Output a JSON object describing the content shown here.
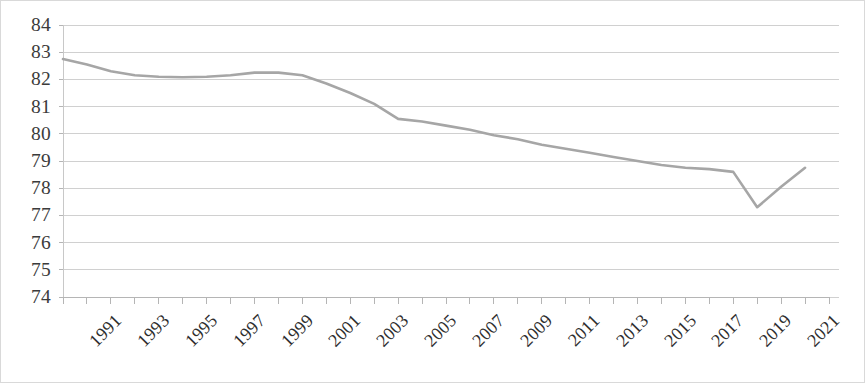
{
  "chart_data": {
    "type": "line",
    "title": "",
    "subtitle": "",
    "xlabel": "",
    "ylabel": "",
    "grid": true,
    "legend": false,
    "legend_position": "none",
    "line_color": "#a6a6a6",
    "gridline_color": "#d0d0d0",
    "axis_color": "#c8c8c8",
    "ylim": [
      74,
      84
    ],
    "ytick_labels": [
      "84",
      "83",
      "82",
      "81",
      "80",
      "79",
      "78",
      "77",
      "76",
      "75",
      "74"
    ],
    "ytick_values": [
      84,
      83,
      82,
      81,
      80,
      79,
      78,
      77,
      76,
      75,
      74
    ],
    "xtick_labels": [
      "1991",
      "1993",
      "1995",
      "1997",
      "1999",
      "2001",
      "2003",
      "2005",
      "2007",
      "2009",
      "2011",
      "2013",
      "2015",
      "2017",
      "2019",
      "2021"
    ],
    "xtick_values": [
      1991,
      1993,
      1995,
      1997,
      1999,
      2001,
      2003,
      2005,
      2007,
      2009,
      2011,
      2013,
      2015,
      2017,
      2019,
      2021
    ],
    "xlim": [
      1991,
      2023
    ],
    "x": [
      1991,
      1992,
      1993,
      1994,
      1995,
      1996,
      1997,
      1998,
      1999,
      2000,
      2001,
      2002,
      2003,
      2004,
      2005,
      2006,
      2007,
      2008,
      2009,
      2010,
      2011,
      2012,
      2013,
      2014,
      2015,
      2016,
      2017,
      2018,
      2019,
      2020,
      2021,
      2022
    ],
    "values": [
      82.75,
      82.55,
      82.3,
      82.15,
      82.1,
      82.08,
      82.1,
      82.15,
      82.25,
      82.25,
      82.15,
      81.85,
      81.5,
      81.1,
      80.55,
      80.45,
      80.3,
      80.15,
      79.95,
      79.8,
      79.6,
      79.45,
      79.3,
      79.15,
      79.0,
      78.85,
      78.75,
      78.7,
      78.6,
      77.3,
      78.05,
      78.75
    ],
    "series": [
      {
        "name": "",
        "values": [
          82.75,
          82.55,
          82.3,
          82.15,
          82.1,
          82.08,
          82.1,
          82.15,
          82.25,
          82.25,
          82.15,
          81.85,
          81.5,
          81.1,
          80.55,
          80.45,
          80.3,
          80.15,
          79.95,
          79.8,
          79.6,
          79.45,
          79.3,
          79.15,
          79.0,
          78.85,
          78.75,
          78.7,
          78.6,
          77.3,
          78.05,
          78.75
        ]
      }
    ]
  }
}
